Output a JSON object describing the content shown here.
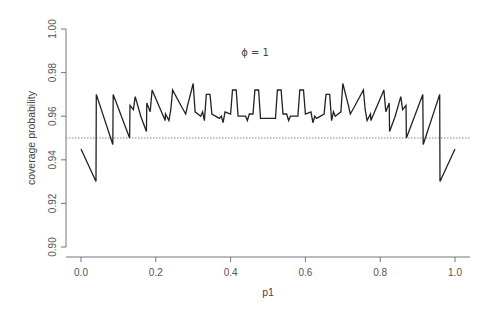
{
  "chart_data": {
    "type": "line",
    "title": "",
    "annotation": "ϕ = 1",
    "xlabel": "p1",
    "ylabel": "coverage probability",
    "xlim": [
      0.0,
      1.0
    ],
    "ylim": [
      0.9,
      1.0
    ],
    "x_ticks": [
      "0.0",
      "0.2",
      "0.4",
      "0.6",
      "0.8",
      "1.0"
    ],
    "y_ticks": [
      "0.90",
      "0.92",
      "0.94",
      "0.96",
      "0.98",
      "1.00"
    ],
    "grid": false,
    "legend": null,
    "reference_line": {
      "y": 0.95,
      "style": "dotted",
      "color": "#888888"
    },
    "series": [
      {
        "name": "coverage",
        "color": "#222222",
        "symmetric_about": 0.5,
        "points_left_half": [
          [
            0.0,
            0.945
          ],
          [
            0.04,
            0.93
          ],
          [
            0.041,
            0.97
          ],
          [
            0.085,
            0.947
          ],
          [
            0.086,
            0.97
          ],
          [
            0.13,
            0.95
          ],
          [
            0.131,
            0.965
          ],
          [
            0.14,
            0.963
          ],
          [
            0.145,
            0.969
          ],
          [
            0.16,
            0.96
          ],
          [
            0.175,
            0.953
          ],
          [
            0.176,
            0.966
          ],
          [
            0.185,
            0.962
          ],
          [
            0.19,
            0.972
          ],
          [
            0.225,
            0.958
          ],
          [
            0.226,
            0.961
          ],
          [
            0.235,
            0.958
          ],
          [
            0.24,
            0.963
          ],
          [
            0.245,
            0.972
          ],
          [
            0.27,
            0.964
          ],
          [
            0.28,
            0.961
          ],
          [
            0.285,
            0.965
          ],
          [
            0.3,
            0.975
          ],
          [
            0.305,
            0.962
          ],
          [
            0.32,
            0.96
          ],
          [
            0.325,
            0.962
          ],
          [
            0.33,
            0.958
          ],
          [
            0.335,
            0.97
          ],
          [
            0.345,
            0.97
          ],
          [
            0.35,
            0.961
          ],
          [
            0.37,
            0.959
          ],
          [
            0.375,
            0.96
          ],
          [
            0.38,
            0.957
          ],
          [
            0.385,
            0.962
          ],
          [
            0.4,
            0.961
          ],
          [
            0.405,
            0.972
          ],
          [
            0.415,
            0.972
          ],
          [
            0.42,
            0.96
          ],
          [
            0.44,
            0.96
          ],
          [
            0.445,
            0.958
          ],
          [
            0.45,
            0.961
          ],
          [
            0.46,
            0.961
          ],
          [
            0.465,
            0.972
          ],
          [
            0.475,
            0.972
          ],
          [
            0.48,
            0.959
          ],
          [
            0.5,
            0.959
          ]
        ]
      }
    ]
  },
  "layout": {
    "plot_left_px": 66,
    "plot_right_px": 470,
    "x0_px": 81,
    "x1_px": 455,
    "y_top_px": 29,
    "y_bottom_px": 247,
    "x_axis_y_px": 257,
    "y_axis_x_px": 66
  }
}
